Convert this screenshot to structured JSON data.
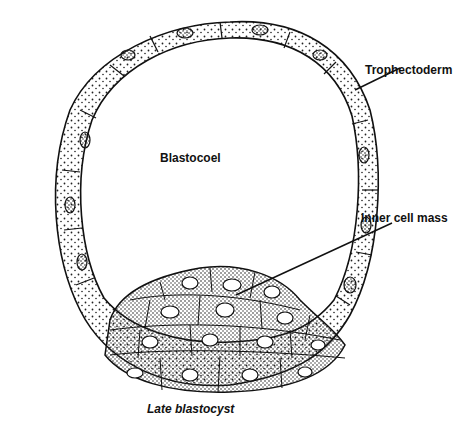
{
  "diagram": {
    "title": "Late blastocyst",
    "labels": {
      "trophectoderm": "Trophectoderm",
      "blastocoel": "Blastocoel",
      "inner_cell_mass": "Inner cell mass"
    }
  }
}
